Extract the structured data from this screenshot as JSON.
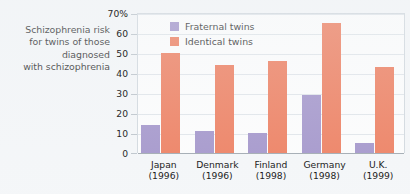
{
  "caption": {
    "lines": [
      "Schizophrenia risk",
      "for twins of those",
      "diagnosed",
      "with schizophrenia"
    ]
  },
  "legend": {
    "position": "top-left-inside",
    "items": [
      {
        "label": "Fraternal twins",
        "color": "#9d8ec7",
        "key": "fraternal"
      },
      {
        "label": "Identical twins",
        "color": "#ed7655",
        "key": "identical"
      }
    ]
  },
  "axis": {
    "y_ticks": [
      {
        "label": "70%",
        "value": 70
      },
      {
        "label": "60",
        "value": 60
      },
      {
        "label": "50",
        "value": 50
      },
      {
        "label": "40",
        "value": 40
      },
      {
        "label": "30",
        "value": 30
      },
      {
        "label": "20",
        "value": 20
      },
      {
        "label": "10",
        "value": 10
      },
      {
        "label": "0",
        "value": 0
      }
    ],
    "x_labels": [
      {
        "country": "Japan",
        "year": "(1996)"
      },
      {
        "country": "Denmark",
        "year": "(1996)"
      },
      {
        "country": "Finland",
        "year": "(1998)"
      },
      {
        "country": "Germany",
        "year": "(1998)"
      },
      {
        "country": "U.K.",
        "year": "(1999)"
      }
    ]
  },
  "chart_data": {
    "type": "bar",
    "title": "Schizophrenia risk for twins of those diagnosed with schizophrenia",
    "xlabel": "",
    "ylabel": "",
    "ylim": [
      0,
      70
    ],
    "ytick_step": 10,
    "ytick_suffix": "%",
    "grid": true,
    "legend_position": "top-left-inside",
    "categories": [
      "Japan (1996)",
      "Denmark (1996)",
      "Finland (1998)",
      "Germany (1998)",
      "U.K. (1999)"
    ],
    "series": [
      {
        "name": "Fraternal twins",
        "color": "#9d8ec7",
        "values": [
          14,
          11,
          10,
          29,
          5
        ]
      },
      {
        "name": "Identical twins",
        "color": "#ed7655",
        "values": [
          50,
          44,
          46,
          65,
          43
        ]
      }
    ]
  },
  "colors": {
    "background": "#f4f6f8",
    "plot_background": "#fdfdfd",
    "gridline": "#dfe4e9",
    "axis": "#9aa3ab",
    "fraternal": "#9d8ec7",
    "identical": "#ed7655",
    "text": "#1c1c1c"
  }
}
